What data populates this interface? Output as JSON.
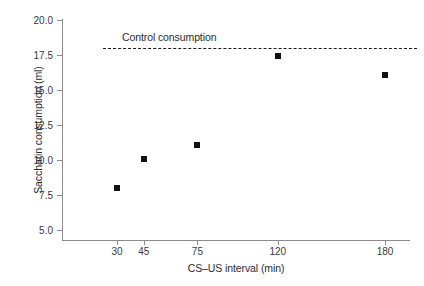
{
  "chart_data": {
    "type": "scatter",
    "title": "",
    "xlabel": "CS–US interval (min)",
    "ylabel": "Saccharin consumption (ml)",
    "x": [
      30,
      45,
      75,
      120,
      180
    ],
    "values": [
      8.0,
      10.1,
      11.1,
      17.4,
      16.1
    ],
    "categories": [
      "30",
      "45",
      "75",
      "120",
      "180"
    ],
    "xtick_labels": [
      "30",
      "45",
      "75",
      "120",
      "180"
    ],
    "ytick_labels": [
      "5.0",
      "7.5",
      "10.0",
      "12.5",
      "15.0",
      "17.5",
      "20.0"
    ],
    "ytick_values": [
      5.0,
      7.5,
      10.0,
      12.5,
      15.0,
      17.5,
      20.0
    ],
    "ylim": [
      4.0,
      20.0
    ],
    "xlim": [
      18,
      212
    ],
    "grid": false,
    "legend": null,
    "marker_style": "filled-square",
    "marker_color": "#121212",
    "axis_color": "#8c8c8c",
    "annotations": [
      {
        "name": "control-consumption",
        "label": "Control consumption",
        "type": "horizontal-reference-line",
        "value": 18.0,
        "style": "dashed",
        "color": "#1a1a1a",
        "x_start": 30,
        "x_end": 190
      }
    ]
  }
}
